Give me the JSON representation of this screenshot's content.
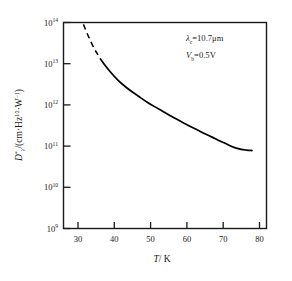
{
  "chart_data": {
    "type": "line",
    "title": "",
    "xlabel": "T/ K",
    "ylabel": "D*λ/(cm·Hz^(1/2)·W^(-1))",
    "ylabel_parts": {
      "symbol": "D",
      "symbol_sub": "λ",
      "symbol_sup": "*",
      "open": "/(cm·Hz",
      "frac_num": "1",
      "frac_den": "2",
      "mid": "·W",
      "exp": "−1",
      "close": ")"
    },
    "xlim": [
      26,
      82
    ],
    "ylim": [
      1000000000.0,
      100000000000000.0
    ],
    "yscale": "log",
    "xticks": [
      30,
      40,
      50,
      60,
      70,
      80
    ],
    "xtick_labels": [
      "30",
      "40",
      "50",
      "60",
      "70",
      "80"
    ],
    "yticks": [
      1000000000.0,
      10000000000.0,
      100000000000.0,
      1000000000000.0,
      10000000000000.0,
      100000000000000.0
    ],
    "ytick_mantissa": [
      "10",
      "10",
      "10",
      "10",
      "10",
      "10"
    ],
    "ytick_exponents": [
      "9",
      "10",
      "11",
      "12",
      "13",
      "14"
    ],
    "grid": false,
    "legend": "none",
    "annotations": [
      {
        "symbol": "λ",
        "subscript": "c",
        "equals": "=10.7",
        "unit": "μm"
      },
      {
        "symbol": "V",
        "subscript": "b",
        "equals": "=0.5",
        "unit": "V"
      }
    ],
    "series": [
      {
        "name": "D* vs T (extrapolated)",
        "style": "dashed",
        "x": [
          31.5,
          32.5,
          33.5,
          34.5,
          35.3,
          36.2
        ],
        "y": [
          90000000000000.0,
          55000000000000.0,
          35000000000000.0,
          23000000000000.0,
          17500000000000.0,
          13000000000000.0
        ]
      },
      {
        "name": "D* vs T (measured)",
        "style": "solid",
        "x": [
          36.2,
          37.5,
          39.0,
          41.0,
          43.0,
          45.0,
          47.0,
          49.0,
          51.0,
          53.0,
          55.0,
          57.0,
          59.0,
          61.0,
          63.0,
          65.0,
          67.0,
          69.0,
          71.0,
          73.0,
          75.0,
          76.5,
          78.0
        ],
        "y": [
          13000000000000.0,
          9000000000000.0,
          6200000000000.0,
          4000000000000.0,
          2800000000000.0,
          2050000000000.0,
          1550000000000.0,
          1180000000000.0,
          920000000000.0,
          730000000000.0,
          580000000000.0,
          460000000000.0,
          370000000000.0,
          300000000000.0,
          245000000000.0,
          200000000000.0,
          165000000000.0,
          135000000000.0,
          112000000000.0,
          93000000000.0,
          83000000000.0,
          80000000000.0,
          78000000000.0
        ]
      }
    ],
    "curve_note": "Monotonic decreasing detectivity with temperature; dashed portion below ~36 K is extrapolated",
    "colors": {
      "axis": "#1a1a1a",
      "curve": "#000000",
      "background": "#ffffff"
    }
  }
}
